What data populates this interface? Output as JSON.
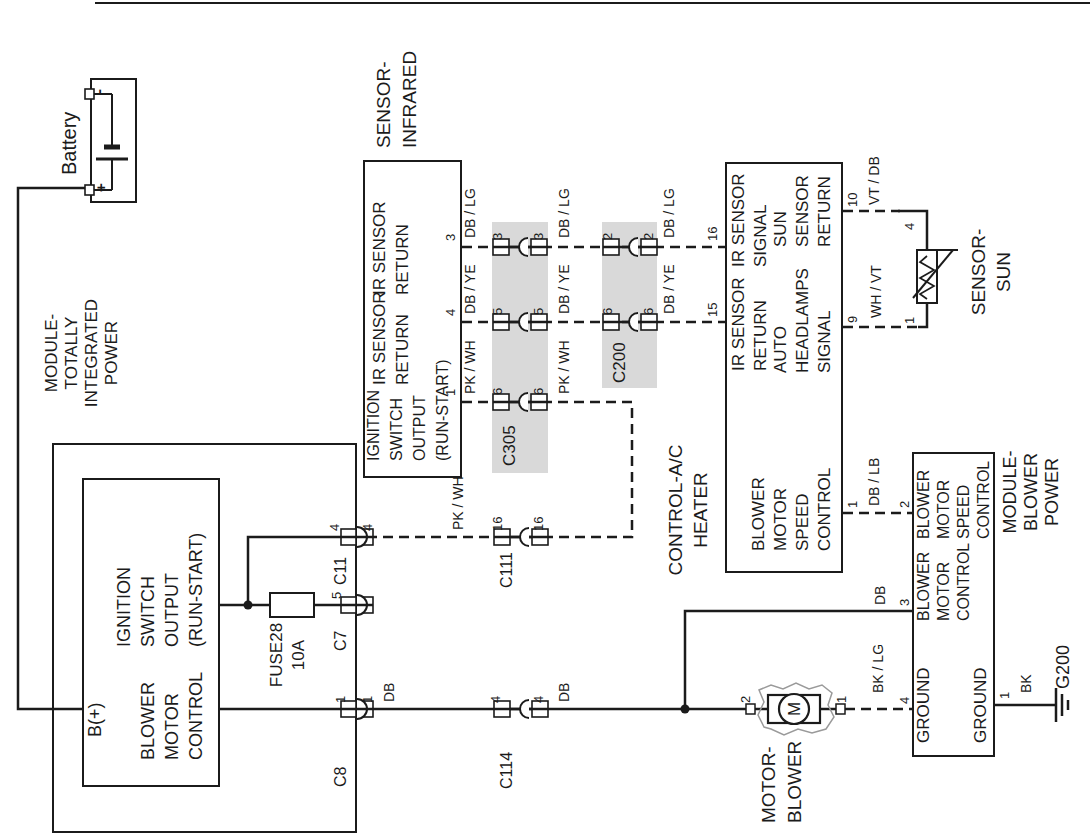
{
  "diagram_title": "Blower motor / HVAC wiring diagram",
  "colors": {
    "bg": "#ffffff",
    "line": "#1b1b1b",
    "text": "#1b1b1b",
    "band": "#d9d9d9",
    "housing": "#9a9a9a"
  },
  "canvas": {
    "w": 1090,
    "h": 835,
    "logical_w": 835,
    "logical_h": 1090
  },
  "boxes": [
    {
      "n": "battery-box",
      "x": 632,
      "y": 90,
      "w": 125,
      "h": 47,
      "bw": 2
    },
    {
      "n": "tipm-outer-box",
      "x": 2,
      "y": 52,
      "w": 390,
      "h": 305,
      "bw": 2.5
    },
    {
      "n": "tipm-inner-box",
      "x": 48,
      "y": 82,
      "w": 309,
      "h": 138,
      "bw": 2
    },
    {
      "n": "ir-sensor-box",
      "x": 357,
      "y": 363,
      "w": 318,
      "h": 99,
      "bw": 2
    },
    {
      "n": "heater-control-box",
      "x": 262,
      "y": 725,
      "w": 411,
      "h": 118,
      "bw": 2
    },
    {
      "n": "blower-power-module-box",
      "x": 78,
      "y": 912,
      "w": 305,
      "h": 83,
      "bw": 2
    }
  ],
  "bands": [
    {
      "n": "connector-band-c305",
      "x": 362,
      "y": 492,
      "w": 251,
      "h": 56
    },
    {
      "n": "connector-band-c200",
      "x": 447,
      "y": 602,
      "w": 166,
      "h": 55
    }
  ],
  "wires": [
    {
      "n": "battery-b-plus-wire",
      "d": 0,
      "p": [
        [
          647,
          85
        ],
        [
          647,
          18
        ],
        [
          126,
          18
        ],
        [
          126,
          82
        ]
      ]
    },
    {
      "n": "ignition-output-wire",
      "d": 0,
      "p": [
        [
          230,
          220
        ],
        [
          230,
          373
        ]
      ]
    },
    {
      "n": "c11-branch-wire",
      "d": 0,
      "p": [
        [
          230,
          248
        ],
        [
          298,
          248
        ],
        [
          298,
          375
        ]
      ]
    },
    {
      "n": "blower-control-wire",
      "d": 0,
      "p": [
        [
          126,
          220
        ],
        [
          126,
          770
        ]
      ]
    },
    {
      "n": "motor-lower-stub",
      "d": 0,
      "p": [
        [
          126,
          820
        ],
        [
          126,
          845
        ]
      ]
    },
    {
      "n": "blower-module-branch-wire",
      "d": 0,
      "p": [
        [
          126,
          685
        ],
        [
          224,
          685
        ],
        [
          224,
          912
        ]
      ]
    },
    {
      "n": "module-ground-wire",
      "d": 0,
      "p": [
        [
          130,
          995
        ],
        [
          130,
          1056
        ]
      ]
    },
    {
      "n": "sun-sensor-right-lead",
      "d": 0,
      "p": [
        [
          624,
          898
        ],
        [
          624,
          927
        ],
        [
          585,
          927
        ]
      ]
    },
    {
      "n": "sun-sensor-left-lead",
      "d": 0,
      "p": [
        [
          508,
          918
        ],
        [
          508,
          927
        ],
        [
          532,
          927
        ]
      ]
    },
    {
      "n": "ir-return-dblg-wire",
      "d": 1,
      "p": [
        [
          588,
          462
        ],
        [
          588,
          725
        ]
      ]
    },
    {
      "n": "ir-return-dbye-wire",
      "d": 1,
      "p": [
        [
          513,
          462
        ],
        [
          513,
          725
        ]
      ]
    },
    {
      "n": "ir-ignition-pkwh-wire",
      "d": 1,
      "p": [
        [
          433,
          462
        ],
        [
          433,
          632
        ],
        [
          298,
          632
        ],
        [
          298,
          375
        ]
      ]
    },
    {
      "n": "blower-speed-dblb-wire",
      "d": 1,
      "p": [
        [
          322,
          843
        ],
        [
          322,
          912
        ]
      ]
    },
    {
      "n": "motor-ground-bklg-wire",
      "d": 1,
      "p": [
        [
          126,
          845
        ],
        [
          126,
          912
        ]
      ]
    },
    {
      "n": "sun-return-vtdb-wire",
      "d": 1,
      "p": [
        [
          624,
          843
        ],
        [
          624,
          900
        ]
      ]
    },
    {
      "n": "sun-signal-whvt-wire",
      "d": 1,
      "p": [
        [
          508,
          843
        ],
        [
          508,
          920
        ]
      ]
    }
  ],
  "junctions": [
    [
      230,
      248
    ],
    [
      126,
      685
    ]
  ],
  "edge_connectors": [
    {
      "n": "tipm-pin-c8",
      "x": 126,
      "y": 357
    },
    {
      "n": "tipm-pin-c7",
      "x": 230,
      "y": 357
    },
    {
      "n": "tipm-pin-c11",
      "x": 298,
      "y": 357
    }
  ],
  "inline_connectors": [
    {
      "n": "connector-c114",
      "x": 126,
      "y": 521
    },
    {
      "n": "connector-c111",
      "x": 298,
      "y": 521
    },
    {
      "n": "connector-c305-pin6",
      "x": 433,
      "y": 520
    },
    {
      "n": "connector-c305-pin5",
      "x": 513,
      "y": 520
    },
    {
      "n": "connector-c305-pin3",
      "x": 588,
      "y": 520
    },
    {
      "n": "connector-c200-pin6",
      "x": 513,
      "y": 630
    },
    {
      "n": "connector-c200-pin2",
      "x": 588,
      "y": 630
    }
  ],
  "fuse": {
    "n": "fuse28-symbol",
    "x": 218,
    "y": 270,
    "w": 24,
    "h": 44
  },
  "battery": {
    "plus_sign": "+",
    "minus_sign": "-",
    "terminals": [
      {
        "x": 640,
        "y": 85,
        "w": 10,
        "h": 9
      },
      {
        "x": 736,
        "y": 85,
        "w": 10,
        "h": 9
      }
    ]
  },
  "motor": {
    "n": "blower-motor-symbol",
    "label": "M",
    "rect": {
      "x": 112,
      "y": 768,
      "w": 28,
      "h": 52
    },
    "circle": {
      "cx": 126,
      "cy": 794,
      "r": 15
    },
    "terminals": [
      [
        121,
        746
      ],
      [
        121,
        836
      ]
    ]
  },
  "sun_sensor": {
    "n": "sun-sensor-symbol",
    "rect": {
      "x": 532,
      "y": 917,
      "w": 53,
      "h": 20
    }
  },
  "ground": {
    "n": "g200-ground-symbol",
    "x": 130,
    "y": 1056
  },
  "page_border": {
    "x": 832,
    "y1": 95,
    "y2": 1090
  },
  "blocks": [
    {
      "n": "battery-label",
      "lines": [
        "Battery"
      ],
      "x": 660,
      "y": 57,
      "f": 20,
      "lh": 24
    },
    {
      "n": "tipm-title",
      "lines": [
        "MODULE-",
        "TOTALLY",
        "INTEGRATED",
        "POWER"
      ],
      "x": 482,
      "y": 42,
      "f": 17,
      "lh": 20,
      "align": "center"
    },
    {
      "n": "tipm-b-plus-label",
      "lines": [
        "B(+)"
      ],
      "x": 98,
      "y": 84,
      "f": 18,
      "lh": 22
    },
    {
      "n": "tipm-ignition-output-label",
      "lines": [
        "IGNITION",
        "SWITCH",
        "OUTPUT",
        "(RUN-START)"
      ],
      "x": 188,
      "y": 112,
      "f": 18,
      "lh": 24
    },
    {
      "n": "tipm-blower-control-label",
      "lines": [
        "BLOWER",
        "MOTOR",
        "CONTROL"
      ],
      "x": 75,
      "y": 136,
      "f": 18,
      "lh": 24
    },
    {
      "n": "fuse28-label",
      "lines": [
        "FUSE28",
        "10A"
      ],
      "x": 180,
      "y": 266,
      "f": 17,
      "lh": 22,
      "align": "center"
    },
    {
      "n": "ir-sensor-title",
      "lines": [
        "SENSOR-",
        "INFRARED"
      ],
      "x": 687,
      "y": 371,
      "f": 19,
      "lh": 26
    },
    {
      "n": "ir-ignition-label",
      "lines": [
        "IGNITION",
        "SWITCH",
        "OUTPUT",
        "(RUN-START)"
      ],
      "x": 374,
      "y": 362,
      "f": 16,
      "lh": 23
    },
    {
      "n": "ir-return-label-1",
      "lines": [
        "IR SENSOR",
        "RETURN"
      ],
      "x": 450,
      "y": 368,
      "f": 17,
      "lh": 23
    },
    {
      "n": "ir-return-label-2",
      "lines": [
        "IR SENSOR",
        "RETURN"
      ],
      "x": 540,
      "y": 368,
      "f": 17,
      "lh": 23
    },
    {
      "n": "heater-title",
      "lines": [
        "CONTROL-A/C",
        "HEATER"
      ],
      "x": 325,
      "y": 663,
      "f": 19,
      "lh": 25,
      "align": "center"
    },
    {
      "n": "heater-ir-return-label",
      "lines": [
        "IR SENSOR",
        "RETURN"
      ],
      "x": 464,
      "y": 728,
      "f": 17,
      "lh": 22
    },
    {
      "n": "heater-ir-signal-label",
      "lines": [
        "IR SENSOR",
        "SIGNAL"
      ],
      "x": 568,
      "y": 728,
      "f": 17,
      "lh": 22
    },
    {
      "n": "heater-blower-speed-label",
      "lines": [
        "BLOWER",
        "MOTOR",
        "SPEED",
        "CONTROL"
      ],
      "x": 284,
      "y": 748,
      "f": 17,
      "lh": 22
    },
    {
      "n": "heater-auto-headlamps-label",
      "lines": [
        "AUTO",
        "HEADLAMPS",
        "SIGNAL"
      ],
      "x": 462,
      "y": 770,
      "f": 17,
      "lh": 22
    },
    {
      "n": "heater-sun-return-label",
      "lines": [
        "SUN",
        "SENSOR",
        "RETURN"
      ],
      "x": 588,
      "y": 770,
      "f": 17,
      "lh": 22
    },
    {
      "n": "motor-title",
      "lines": [
        "MOTOR-",
        "BLOWER"
      ],
      "x": 12,
      "y": 756,
      "f": 19,
      "lh": 26
    },
    {
      "n": "module-title",
      "lines": [
        "MODULE-",
        "BLOWER",
        "POWER"
      ],
      "x": 343,
      "y": 1000,
      "f": 18,
      "lh": 21,
      "align": "center"
    },
    {
      "n": "module-ground-label-top",
      "lines": [
        "GROUND"
      ],
      "x": 92,
      "y": 914,
      "f": 17,
      "lh": 20
    },
    {
      "n": "module-blower-control-label",
      "lines": [
        "BLOWER",
        "MOTOR",
        "CONTROL"
      ],
      "x": 214,
      "y": 914,
      "f": 16,
      "lh": 20
    },
    {
      "n": "module-blower-speed-label",
      "lines": [
        "BLOWER",
        "MOTOR",
        "SPEED",
        "CONTROL"
      ],
      "x": 296,
      "y": 914,
      "f": 16,
      "lh": 20
    },
    {
      "n": "module-ground-label-bottom",
      "lines": [
        "GROUND"
      ],
      "x": 92,
      "y": 971,
      "f": 17,
      "lh": 20
    },
    {
      "n": "sun-sensor-title",
      "lines": [
        "SENSOR-",
        "SUN"
      ],
      "x": 563,
      "y": 966,
      "f": 19,
      "lh": 25,
      "align": "center"
    }
  ],
  "labels": [
    {
      "n": "wire-color",
      "t": "DB / LG",
      "x": 597,
      "y": 462,
      "f": 14
    },
    {
      "n": "wire-color",
      "t": "DB / LG",
      "x": 597,
      "y": 556,
      "f": 14
    },
    {
      "n": "wire-color",
      "t": "DB / LG",
      "x": 597,
      "y": 661,
      "f": 14
    },
    {
      "n": "wire-color",
      "t": "DB / YE",
      "x": 521,
      "y": 462,
      "f": 14
    },
    {
      "n": "wire-color",
      "t": "DB / YE",
      "x": 521,
      "y": 556,
      "f": 14
    },
    {
      "n": "wire-color",
      "t": "DB / YE",
      "x": 521,
      "y": 661,
      "f": 14
    },
    {
      "n": "wire-color",
      "t": "PK / WH",
      "x": 441,
      "y": 462,
      "f": 14
    },
    {
      "n": "wire-color",
      "t": "PK / WH",
      "x": 441,
      "y": 556,
      "f": 14
    },
    {
      "n": "wire-color",
      "t": "PK / WH",
      "x": 305,
      "y": 450,
      "f": 14
    },
    {
      "n": "wire-color",
      "t": "DB",
      "x": 133,
      "y": 381,
      "f": 14
    },
    {
      "n": "wire-color",
      "t": "DB",
      "x": 133,
      "y": 556,
      "f": 14
    },
    {
      "n": "wire-color",
      "t": "DB",
      "x": 230,
      "y": 872,
      "f": 14
    },
    {
      "n": "wire-color",
      "t": "DB / LB",
      "x": 329,
      "y": 866,
      "f": 14
    },
    {
      "n": "wire-color",
      "t": "BK / LG",
      "x": 142,
      "y": 870,
      "f": 14
    },
    {
      "n": "wire-color",
      "t": "WH / VT",
      "x": 517,
      "y": 868,
      "f": 14
    },
    {
      "n": "wire-color",
      "t": "VT / DB",
      "x": 630,
      "y": 866,
      "f": 14
    },
    {
      "n": "wire-color",
      "t": "BK",
      "x": 142,
      "y": 1018,
      "f": 14
    },
    {
      "n": "pin-number",
      "t": "3",
      "x": 594,
      "y": 443,
      "f": 13
    },
    {
      "n": "pin-number",
      "t": "4",
      "x": 519,
      "y": 443,
      "f": 13
    },
    {
      "n": "pin-number",
      "t": "1",
      "x": 439,
      "y": 443,
      "f": 13
    },
    {
      "n": "pin-number",
      "t": "3",
      "x": 595,
      "y": 490,
      "f": 13
    },
    {
      "n": "pin-number",
      "t": "3",
      "x": 595,
      "y": 531,
      "f": 13
    },
    {
      "n": "pin-number",
      "t": "5",
      "x": 520,
      "y": 490,
      "f": 13
    },
    {
      "n": "pin-number",
      "t": "5",
      "x": 520,
      "y": 531,
      "f": 13
    },
    {
      "n": "pin-number",
      "t": "6",
      "x": 440,
      "y": 490,
      "f": 13
    },
    {
      "n": "pin-number",
      "t": "6",
      "x": 440,
      "y": 531,
      "f": 13
    },
    {
      "n": "pin-number",
      "t": "2",
      "x": 595,
      "y": 600,
      "f": 13
    },
    {
      "n": "pin-number",
      "t": "2",
      "x": 595,
      "y": 641,
      "f": 13
    },
    {
      "n": "pin-number",
      "t": "6",
      "x": 520,
      "y": 600,
      "f": 13
    },
    {
      "n": "pin-number",
      "t": "6",
      "x": 520,
      "y": 641,
      "f": 13
    },
    {
      "n": "pin-number",
      "t": "16",
      "x": 304,
      "y": 490,
      "f": 13
    },
    {
      "n": "pin-number",
      "t": "16",
      "x": 304,
      "y": 531,
      "f": 13
    },
    {
      "n": "pin-number",
      "t": "4",
      "x": 132,
      "y": 488,
      "f": 13
    },
    {
      "n": "pin-number",
      "t": "4",
      "x": 132,
      "y": 531,
      "f": 13
    },
    {
      "n": "pin-number",
      "t": "1",
      "x": 132,
      "y": 333,
      "f": 13
    },
    {
      "n": "pin-number",
      "t": "1",
      "x": 132,
      "y": 360,
      "f": 13
    },
    {
      "n": "pin-number",
      "t": "5",
      "x": 236,
      "y": 329,
      "f": 13
    },
    {
      "n": "pin-number",
      "t": "4",
      "x": 304,
      "y": 327,
      "f": 13
    },
    {
      "n": "pin-number",
      "t": "4",
      "x": 304,
      "y": 360,
      "f": 13
    },
    {
      "n": "pin-number",
      "t": "15",
      "x": 518,
      "y": 705,
      "f": 13
    },
    {
      "n": "pin-number",
      "t": "16",
      "x": 594,
      "y": 705,
      "f": 13
    },
    {
      "n": "pin-number",
      "t": "1",
      "x": 327,
      "y": 845,
      "f": 13
    },
    {
      "n": "pin-number",
      "t": "9",
      "x": 512,
      "y": 845,
      "f": 13
    },
    {
      "n": "pin-number",
      "t": "10",
      "x": 628,
      "y": 845,
      "f": 13
    },
    {
      "n": "pin-number",
      "t": "4",
      "x": 131,
      "y": 897,
      "f": 13
    },
    {
      "n": "pin-number",
      "t": "3",
      "x": 229,
      "y": 897,
      "f": 13
    },
    {
      "n": "pin-number",
      "t": "2",
      "x": 327,
      "y": 897,
      "f": 13
    },
    {
      "n": "pin-number",
      "t": "1",
      "x": 136,
      "y": 997,
      "f": 13
    },
    {
      "n": "pin-number",
      "t": "2",
      "x": 132,
      "y": 738,
      "f": 13
    },
    {
      "n": "pin-number",
      "t": "1",
      "x": 132,
      "y": 834,
      "f": 13
    },
    {
      "n": "pin-number",
      "t": "1",
      "x": 511,
      "y": 902,
      "f": 13
    },
    {
      "n": "pin-number",
      "t": "4",
      "x": 605,
      "y": 902,
      "f": 13
    },
    {
      "n": "connector-name",
      "t": "C8",
      "x": 48,
      "y": 331,
      "f": 16
    },
    {
      "n": "connector-name",
      "t": "C7",
      "x": 184,
      "y": 331,
      "f": 16
    },
    {
      "n": "connector-name",
      "t": "C11",
      "x": 250,
      "y": 331,
      "f": 16
    },
    {
      "n": "connector-name",
      "t": "C111",
      "x": 247,
      "y": 497,
      "f": 16
    },
    {
      "n": "connector-name",
      "t": "C114",
      "x": 46,
      "y": 497,
      "f": 16
    },
    {
      "n": "connector-name",
      "t": "C305",
      "x": 369,
      "y": 500,
      "f": 17
    },
    {
      "n": "connector-name",
      "t": "C200",
      "x": 452,
      "y": 610,
      "f": 17
    },
    {
      "n": "ground-name",
      "t": "G200",
      "x": 146,
      "y": 1053,
      "f": 18
    }
  ]
}
